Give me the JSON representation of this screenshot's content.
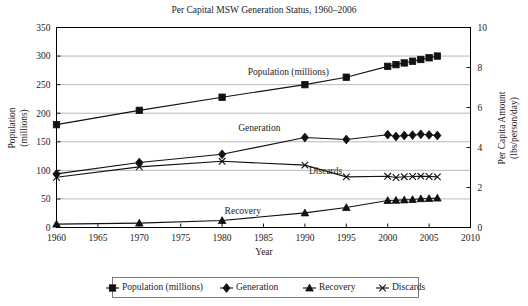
{
  "chart_data": {
    "type": "line",
    "title": "Per Capital MSW Generation Status, 1960–2006",
    "xlabel": "Year",
    "ylabel": "Population\n(millions)",
    "ylabel_left_line1": "Population",
    "ylabel_left_line2": "(millions)",
    "ylabel_right_line1": "Per Capita Amount",
    "ylabel_right_line2": "(lbs/person/day)",
    "xlim": [
      1960,
      2010
    ],
    "xticks": [
      1960,
      1965,
      1970,
      1975,
      1980,
      1985,
      1990,
      1995,
      2000,
      2005,
      2010
    ],
    "xtick_labels": [
      "1960",
      "1965",
      "1970",
      "1975",
      "1980",
      "1985",
      "1990",
      "1995",
      "2000",
      "2005",
      "2010"
    ],
    "ylim_left": [
      0,
      350
    ],
    "yticks_left": [
      0,
      50,
      100,
      150,
      200,
      250,
      300,
      350
    ],
    "ytick_labels_left": [
      "0",
      "50",
      "100",
      "150",
      "200",
      "250",
      "300",
      "350"
    ],
    "ylim_right": [
      0,
      10
    ],
    "yticks_right": [
      0,
      2,
      4,
      6,
      8,
      10
    ],
    "ytick_labels_right": [
      "0",
      "2",
      "4",
      "6",
      "8",
      "10"
    ],
    "grid": true,
    "legend_position": "bottom",
    "x": [
      1960,
      1970,
      1980,
      1990,
      1995,
      2000,
      2001,
      2002,
      2003,
      2004,
      2005,
      2006
    ],
    "series": [
      {
        "name": "Population (millions)",
        "axis": "left",
        "marker": "square",
        "annotation": "Population (millions)",
        "values": [
          180,
          205,
          228,
          250,
          263,
          282,
          285,
          288,
          291,
          294,
          297,
          300
        ]
      },
      {
        "name": "Generation",
        "axis": "right",
        "marker": "diamond",
        "annotation": "Generation",
        "values": [
          2.68,
          3.25,
          3.66,
          4.5,
          4.4,
          4.64,
          4.55,
          4.6,
          4.62,
          4.66,
          4.63,
          4.6
        ]
      },
      {
        "name": "Recovery",
        "axis": "right",
        "marker": "triangle",
        "annotation": "Recovery",
        "values": [
          0.17,
          0.22,
          0.35,
          0.73,
          1.0,
          1.35,
          1.36,
          1.38,
          1.4,
          1.44,
          1.45,
          1.47
        ]
      },
      {
        "name": "Discards",
        "axis": "right",
        "marker": "cross",
        "annotation": "Discards",
        "values": [
          2.51,
          3.03,
          3.31,
          3.12,
          2.53,
          2.56,
          2.5,
          2.54,
          2.55,
          2.57,
          2.55,
          2.53
        ]
      }
    ],
    "annotations": [
      {
        "text": "Population (millions)",
        "x": 1988,
        "y": 272,
        "axis": "left"
      },
      {
        "text": "Generation",
        "x": 1984.5,
        "y": 175,
        "axis": "left"
      },
      {
        "text": "Discards",
        "x": 1992.5,
        "y": 100,
        "axis": "left"
      },
      {
        "text": "Recovery",
        "x": 1982.5,
        "y": 29,
        "axis": "left"
      }
    ],
    "legend": [
      {
        "label": "Population (millions)",
        "marker": "square"
      },
      {
        "label": "Generation",
        "marker": "diamond"
      },
      {
        "label": "Recovery",
        "marker": "triangle"
      },
      {
        "label": "Discards",
        "marker": "cross"
      }
    ],
    "colors": {
      "series": "#111111",
      "grid": "#9a9a9a",
      "frame": "#000000",
      "background": "#ffffff"
    }
  }
}
